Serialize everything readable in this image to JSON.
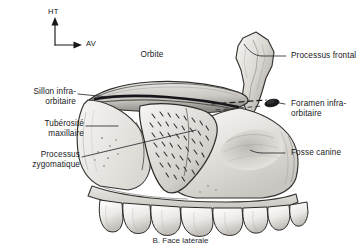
{
  "figure": {
    "title_caption": "B. Face latérale",
    "orientation_marker": {
      "up_label": "HT",
      "forward_label": "AV"
    },
    "colors": {
      "ink": "#17171a",
      "leader_line": "#2b2b2f",
      "bone_light": "#f2f1ef",
      "bone_mid": "#d9d7d3",
      "bone_shadow": "#9d9a95",
      "bone_dark": "#5d5a56",
      "background": "#ffffff"
    },
    "labels": [
      {
        "id": "orbite",
        "text": "Orbite",
        "side": "top"
      },
      {
        "id": "sillon",
        "text": "Sillon infra-\norbitaire",
        "side": "left"
      },
      {
        "id": "tuberosite",
        "text": "Tubérosité\nmaxillaire",
        "side": "left"
      },
      {
        "id": "zygomatique",
        "text": "Processus\nzygomatique",
        "side": "left"
      },
      {
        "id": "frontal",
        "text": "Processus frontal",
        "side": "right"
      },
      {
        "id": "foramen",
        "text": "Foramen infra-\norbitaire",
        "side": "right"
      },
      {
        "id": "fosse",
        "text": "Fosse canine",
        "side": "right"
      }
    ]
  }
}
